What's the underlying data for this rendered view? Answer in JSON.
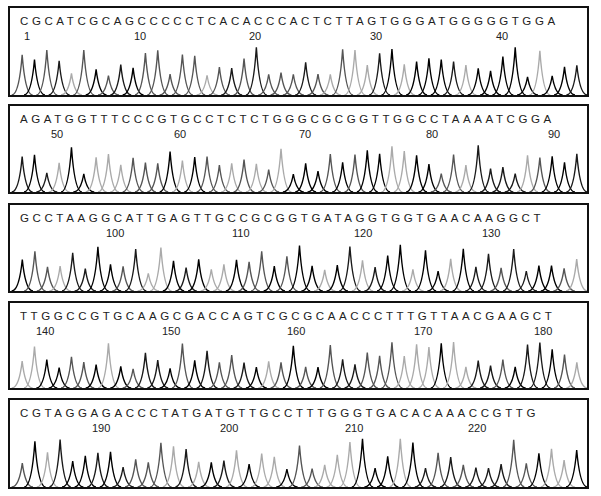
{
  "chart_data": {
    "type": "line",
    "title": "",
    "xlabel": "",
    "ylabel": "",
    "grid": false,
    "panels": [
      {
        "sequence": "CGCATCGCAGCCCCCTCACACCCACTCTTAGTGGGATGGGGGTGGA",
        "start": 1,
        "ticks": [
          {
            "label": "1",
            "x": 22
          },
          {
            "label": "10",
            "x": 132
          },
          {
            "label": "20",
            "x": 247
          },
          {
            "label": "30",
            "x": 368
          },
          {
            "label": "40",
            "x": 494
          }
        ]
      },
      {
        "sequence": "AGATGGTTTCCCGTGCCTCTCTGGGCGCGGTTGGCCTAAAATCGGA",
        "start": 47,
        "ticks": [
          {
            "label": "50",
            "x": 49
          },
          {
            "label": "60",
            "x": 172
          },
          {
            "label": "70",
            "x": 297
          },
          {
            "label": "80",
            "x": 424
          },
          {
            "label": "90",
            "x": 546
          }
        ]
      },
      {
        "sequence": "GCCTAAGGCATTGAGTTGCCGCGGTGATAGGTGGTGAACAAGGCT",
        "start": 93,
        "ticks": [
          {
            "label": "100",
            "x": 104
          },
          {
            "label": "110",
            "x": 230
          },
          {
            "label": "120",
            "x": 352
          },
          {
            "label": "130",
            "x": 480
          }
        ]
      },
      {
        "sequence": "TTGGCCGTGCAAGCGACCAGTCGCGCAACCCTTTGTTAACGAAGCT",
        "start": 138,
        "ticks": [
          {
            "label": "140",
            "x": 34
          },
          {
            "label": "150",
            "x": 160
          },
          {
            "label": "160",
            "x": 285
          },
          {
            "label": "170",
            "x": 412
          },
          {
            "label": "180",
            "x": 532
          }
        ]
      },
      {
        "sequence": "CGTAGGAGACCCTATGATGTTGCCTTTGGGTGACACAAACCGTTG",
        "start": 184,
        "ticks": [
          {
            "label": "190",
            "x": 90
          },
          {
            "label": "200",
            "x": 218
          },
          {
            "label": "210",
            "x": 343
          },
          {
            "label": "220",
            "x": 466
          }
        ]
      }
    ],
    "legend": [],
    "trace_colors": {
      "A": "#1a1a1a",
      "C": "#555555",
      "G": "#000000",
      "T": "#aaaaaa"
    }
  }
}
